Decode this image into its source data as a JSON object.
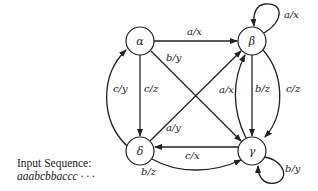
{
  "nodes": [
    {
      "id": "alpha",
      "label": "α"
    },
    {
      "id": "beta",
      "label": "β"
    },
    {
      "id": "gamma",
      "label": "γ"
    },
    {
      "id": "delta",
      "label": "δ"
    }
  ],
  "edges": [
    {
      "from": "alpha",
      "to": "beta",
      "label": "a/x"
    },
    {
      "from": "beta",
      "to": "beta",
      "label": "a/x"
    },
    {
      "from": "alpha",
      "to": "gamma",
      "label": "b/y"
    },
    {
      "from": "alpha",
      "to": "delta",
      "label": "c/z"
    },
    {
      "from": "delta",
      "to": "alpha",
      "label": "c/y"
    },
    {
      "from": "delta",
      "to": "beta",
      "label": "a/y"
    },
    {
      "from": "gamma",
      "to": "beta",
      "label": "a/x"
    },
    {
      "from": "beta",
      "to": "gamma",
      "label": "b/z"
    },
    {
      "from": "beta",
      "to": "gamma",
      "label": "c/z"
    },
    {
      "from": "gamma",
      "to": "delta",
      "label": "c/x"
    },
    {
      "from": "delta",
      "to": "gamma",
      "label": "b/z"
    },
    {
      "from": "gamma",
      "to": "gamma",
      "label": "b/y"
    }
  ],
  "caption": {
    "title": "Input Sequence:",
    "sequence": "aaabcbbaccc · · ·"
  }
}
